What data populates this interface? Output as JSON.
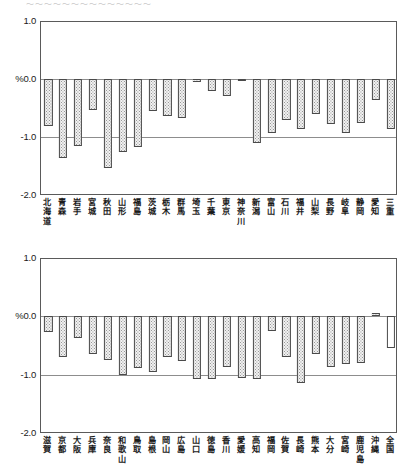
{
  "header": {
    "cut_off_text": "〜〜〜〜〜〜〜〜〜〜〜〜〜〜"
  },
  "chart_data": [
    {
      "id": "chart-top",
      "type": "bar",
      "title": "",
      "xlabel": "",
      "ylabel": "%",
      "ylim": [
        -2.0,
        1.0
      ],
      "yticks": [
        "1.0",
        "%0.0",
        "-1.0",
        "-2.0"
      ],
      "ytick_values": [
        1.0,
        0.0,
        -1.0,
        -2.0
      ],
      "grid": true,
      "legend": "none",
      "categories": [
        "北海道",
        "青森",
        "岩手",
        "宮城",
        "秋田",
        "山形",
        "福島",
        "茨城",
        "栃木",
        "群馬",
        "埼玉",
        "千葉",
        "東京",
        "神奈川",
        "新潟",
        "富山",
        "石川",
        "福井",
        "山梨",
        "長野",
        "岐阜",
        "静岡",
        "愛知",
        "三重"
      ],
      "values": [
        -0.81,
        -1.36,
        -1.15,
        -0.54,
        -1.53,
        -1.25,
        -1.18,
        -0.55,
        -0.63,
        -0.68,
        -0.05,
        -0.2,
        -0.3,
        -0.01,
        -1.1,
        -0.93,
        -0.7,
        -0.87,
        -0.61,
        -0.77,
        -0.93,
        -0.75,
        -0.37,
        -0.86
      ],
      "styles": [
        "dotted",
        "dotted",
        "dotted",
        "dotted",
        "dotted",
        "dotted",
        "dotted",
        "dotted",
        "dotted",
        "dotted",
        "dotted",
        "dotted",
        "dotted",
        "dotted",
        "dotted",
        "dotted",
        "dotted",
        "dotted",
        "dotted",
        "dotted",
        "dotted",
        "dotted",
        "dotted",
        "dotted"
      ]
    },
    {
      "id": "chart-bottom",
      "type": "bar",
      "title": "",
      "xlabel": "",
      "ylabel": "%",
      "ylim": [
        -2.0,
        1.0
      ],
      "yticks": [
        "1.0",
        "%0.0",
        "-1.0",
        "-2.0"
      ],
      "ytick_values": [
        1.0,
        0.0,
        -1.0,
        -2.0
      ],
      "grid": true,
      "legend": "none",
      "categories": [
        "滋賀",
        "京都",
        "大阪",
        "兵庫",
        "奈良",
        "和歌山",
        "鳥取",
        "島根",
        "岡山",
        "広島",
        "山口",
        "徳島",
        "香川",
        "愛媛",
        "高知",
        "福岡",
        "佐賀",
        "長崎",
        "熊本",
        "大分",
        "宮崎",
        "鹿児島",
        "沖縄",
        "全国"
      ],
      "values": [
        -0.27,
        -0.7,
        -0.38,
        -0.64,
        -0.75,
        -1.0,
        -0.88,
        -0.95,
        -0.7,
        -0.77,
        -1.08,
        -1.07,
        -0.87,
        -1.06,
        -1.08,
        -0.25,
        -0.7,
        -1.14,
        -0.64,
        -0.87,
        -0.82,
        -0.8,
        0.05,
        -0.55
      ],
      "styles": [
        "dotted",
        "dotted",
        "dotted",
        "dotted",
        "dotted",
        "dotted",
        "dotted",
        "dotted",
        "dotted",
        "dotted",
        "dotted",
        "dotted",
        "dotted",
        "dotted",
        "dotted",
        "dotted",
        "dotted",
        "dotted",
        "dotted",
        "dotted",
        "dotted",
        "dotted",
        "dotted",
        "plain"
      ]
    }
  ],
  "colors": {
    "bar_fill": "#f2f2f2",
    "bar_border": "#4a4a4a",
    "axis": "#5a5a5a",
    "grid": "#8d8d8d",
    "text": "#1a1a1a"
  }
}
